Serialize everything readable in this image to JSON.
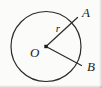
{
  "figure": {
    "kind": "circle-with-two-radii",
    "background_color": "#fbfbf9",
    "stroke_color": "#2b2b2b",
    "label_color": "#1c1c1c",
    "width": 102,
    "height": 88,
    "circle": {
      "center_x": 46,
      "center_y": 46.5,
      "radius": 35,
      "stroke_width": 1.2
    },
    "center_point": {
      "x": 46,
      "y": 46.5,
      "size": 3.4,
      "shape": "square-dot"
    },
    "radii": [
      {
        "name": "radius-to-A",
        "from_x": 46,
        "from_y": 46.5,
        "to_x": 77.5,
        "to_y": 17.5,
        "stroke_width": 1.2
      },
      {
        "name": "radius-to-B",
        "from_x": 46,
        "from_y": 46.5,
        "to_x": 81.5,
        "to_y": 65.5,
        "stroke_width": 1.2
      }
    ],
    "labels": {
      "point_a": {
        "text": "A",
        "x": 82,
        "y": 17
      },
      "point_b": {
        "text": "B",
        "x": 87,
        "y": 71
      },
      "center_o": {
        "text": "O",
        "x": 30,
        "y": 57
      },
      "radius_r": {
        "text": "r",
        "x": 58,
        "y": 32
      }
    }
  }
}
